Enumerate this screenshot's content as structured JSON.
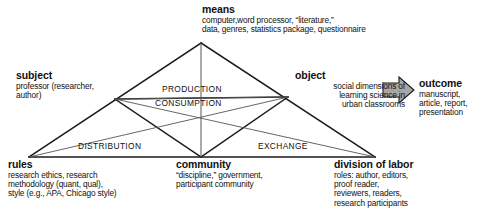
{
  "diagram": {
    "nodes": {
      "means": {
        "heading": "means",
        "body": "computer,word processor, “literature,”\ndata, genres, statistics package, questionnaire"
      },
      "subject": {
        "heading": "subject",
        "body": "professor (researcher,\nauthor)"
      },
      "object": {
        "heading": "object",
        "body": "social dimensions of\nlearning science in\nurban classrooms"
      },
      "outcome": {
        "heading": "outcome",
        "body": "manuscript,\narticle, report,\npresentation"
      },
      "rules": {
        "heading": "rules",
        "body": "research ethics, research\nmethodology (quant, qual),\nstyle (e.g., APA, Chicago style)"
      },
      "community": {
        "heading": "community",
        "body": "“discipline,” government,\nparticipant community"
      },
      "division": {
        "heading": "division of labor",
        "body": "roles: author, editors,\nproof reader,\nreviewers, readers,\nresearch participants"
      }
    },
    "bands": {
      "production": "PRODUCTION",
      "consumption": "CONSUMPTION",
      "distribution": "DISTRIBUTION",
      "exchange": "EXCHANGE"
    },
    "arrow": {
      "name": "outcome-arrow",
      "direction": "right",
      "fill": "#a6a6a6",
      "stroke": "#1a1a1a"
    },
    "colors": {
      "line_dark": "#1a1a1a",
      "line_thin": "#555555",
      "text": "#111111",
      "background": "#ffffff"
    },
    "geometry": {
      "vertices": {
        "means": [
          201,
          43
        ],
        "subject": [
          115,
          99
        ],
        "object": [
          288,
          97
        ],
        "rules": [
          29,
          157
        ],
        "community": [
          201,
          157
        ],
        "division": [
          375,
          157
        ]
      }
    }
  }
}
